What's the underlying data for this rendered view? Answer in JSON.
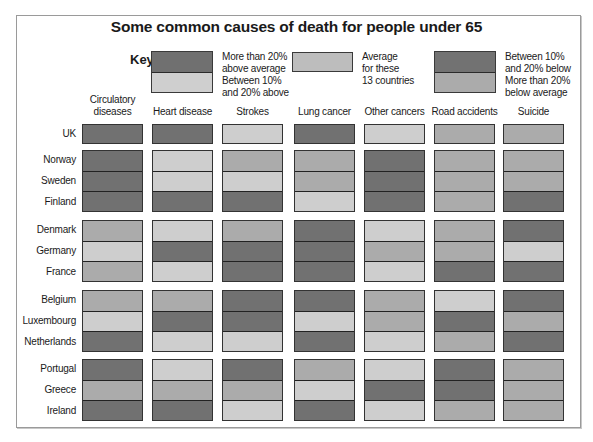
{
  "chart_data": {
    "type": "heatmap",
    "title": "Some common causes of death for people under 65",
    "key_label": "Key",
    "legend": [
      {
        "id": "gt20_above",
        "label": "More than 20% above average",
        "color": "#707070"
      },
      {
        "id": "10_20_above",
        "label": "Between 10% and 20% above",
        "color": "#cfcfcf"
      },
      {
        "id": "average",
        "label": "Average for these 13 countries",
        "color": "#bdbdbd"
      },
      {
        "id": "10_20_below",
        "label": "Between 10% and 20% below",
        "color": "#727272"
      },
      {
        "id": "gt20_below",
        "label": "More than 20% below average",
        "color": "#ababab"
      }
    ],
    "shade_scale": {
      "D": "#717171",
      "M": "#ababab",
      "A": "#bdbdbd",
      "L": "#cecece"
    },
    "columns": [
      "Circulatory diseases",
      "Heart disease",
      "Strokes",
      "Lung cancer",
      "Other cancers",
      "Road accidents",
      "Suicide"
    ],
    "groups": [
      {
        "rows": [
          {
            "country": "UK",
            "cells": [
              "D",
              "D",
              "L",
              "D",
              "L",
              "M",
              "M"
            ]
          }
        ]
      },
      {
        "rows": [
          {
            "country": "Norway",
            "cells": [
              "D",
              "L",
              "M",
              "M",
              "D",
              "M",
              "M"
            ]
          },
          {
            "country": "Sweden",
            "cells": [
              "D",
              "L",
              "L",
              "M",
              "D",
              "M",
              "M"
            ]
          },
          {
            "country": "Finland",
            "cells": [
              "D",
              "D",
              "D",
              "L",
              "D",
              "M",
              "D"
            ]
          }
        ]
      },
      {
        "rows": [
          {
            "country": "Denmark",
            "cells": [
              "M",
              "L",
              "M",
              "D",
              "L",
              "M",
              "D"
            ]
          },
          {
            "country": "Germany",
            "cells": [
              "L",
              "D",
              "D",
              "D",
              "M",
              "M",
              "L"
            ]
          },
          {
            "country": "France",
            "cells": [
              "M",
              "L",
              "D",
              "D",
              "L",
              "D",
              "D"
            ]
          }
        ]
      },
      {
        "rows": [
          {
            "country": "Belgium",
            "cells": [
              "M",
              "M",
              "D",
              "D",
              "M",
              "L",
              "D"
            ]
          },
          {
            "country": "Luxembourg",
            "cells": [
              "L",
              "D",
              "D",
              "L",
              "M",
              "D",
              "M"
            ]
          },
          {
            "country": "Netherlands",
            "cells": [
              "D",
              "L",
              "L",
              "D",
              "L",
              "M",
              "D"
            ]
          }
        ]
      },
      {
        "rows": [
          {
            "country": "Portugal",
            "cells": [
              "D",
              "L",
              "D",
              "M",
              "L",
              "D",
              "M"
            ]
          },
          {
            "country": "Greece",
            "cells": [
              "M",
              "M",
              "M",
              "L",
              "D",
              "D",
              "M"
            ]
          },
          {
            "country": "Ireland",
            "cells": [
              "D",
              "D",
              "L",
              "D",
              "L",
              "M",
              "M"
            ]
          }
        ]
      }
    ]
  },
  "key_text": {
    "gt20_above": [
      "More than 20%",
      "above average"
    ],
    "10_20_above": [
      "Between 10%",
      "and 20% above"
    ],
    "average": [
      "Average",
      "for these",
      "13 countries"
    ],
    "10_20_below": [
      "Between 10%",
      "and 20% below"
    ],
    "gt20_below": [
      "More than 20%",
      "below average"
    ]
  },
  "column_headers": [
    [
      "Circulatory",
      "diseases"
    ],
    [
      "Heart disease"
    ],
    [
      "Strokes"
    ],
    [
      "Lung cancer"
    ],
    [
      "Other cancers"
    ],
    [
      "Road accidents"
    ],
    [
      "Suicide"
    ]
  ]
}
